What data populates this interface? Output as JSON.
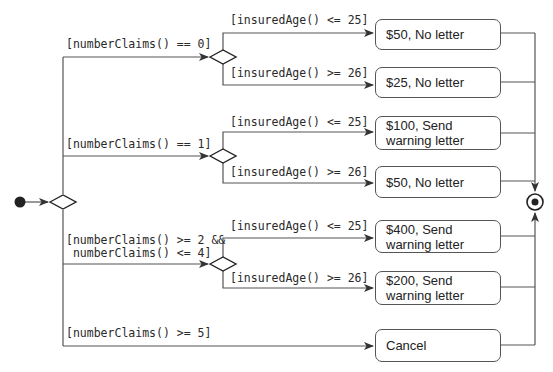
{
  "diagram": {
    "type": "UML activity diagram",
    "colors": {
      "line": "#555555",
      "text": "#222222",
      "background": "#ffffff"
    },
    "main_decision_guards": [
      {
        "id": "g0",
        "label": "[numberClaims() == 0]"
      },
      {
        "id": "g1",
        "label": "[numberClaims() == 1]"
      },
      {
        "id": "g2",
        "label": "[numberClaims() >= 2 &&\n numberClaims() <= 4]"
      },
      {
        "id": "g3",
        "label": "[numberClaims() >= 5]"
      }
    ],
    "sub_decisions": [
      {
        "young": "[insuredAge() <= 25]",
        "old": "[insuredAge() >= 26]"
      },
      {
        "young": "[insuredAge() <= 25]",
        "old": "[insuredAge() >= 26]"
      },
      {
        "young": "[insuredAge() <= 25]",
        "old": "[insuredAge() >= 26]"
      }
    ],
    "actions": [
      {
        "label": "$50, No letter"
      },
      {
        "label": "$25, No letter"
      },
      {
        "label": "$100, Send\nwarning letter"
      },
      {
        "label": "$50, No letter"
      },
      {
        "label": "$400, Send\nwarning letter"
      },
      {
        "label": "$200, Send\nwarning letter"
      },
      {
        "label": "Cancel"
      }
    ],
    "nodes": {
      "initial": "initial-node",
      "final": "activity-final-node"
    }
  }
}
